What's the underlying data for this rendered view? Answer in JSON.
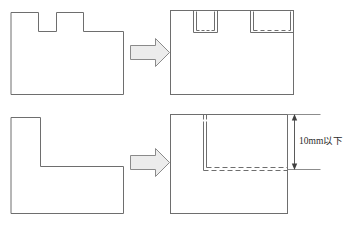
{
  "diagram": {
    "canvas": {
      "width": 343,
      "height": 226
    },
    "stroke_color": "#6e6e6e",
    "arrow_fill_color": "#ececec",
    "arrow_stroke_color": "#8a8a8a",
    "dimension_color": "#404040",
    "background_color": "#ffffff",
    "rows": [
      {
        "id": "row-top",
        "before": {
          "name": "top-left-notched-plate",
          "description": "Rectangular plate with two square notches cut into the top edge",
          "notch_count": 2
        },
        "arrow": {
          "name": "transform-arrow-top",
          "direction": "right",
          "glyph": "➡"
        },
        "after": {
          "name": "top-right-filled-plate",
          "description": "Full rectangular plate with the two former notches shown as inner outlines, bottoms drawn dashed",
          "notch_count": 2,
          "inner_line_styles": [
            "solid-sides",
            "dashed-bottom"
          ]
        }
      },
      {
        "id": "row-bottom",
        "before": {
          "name": "bottom-left-l-shape",
          "description": "L-shaped plate, large notch removed from the upper right"
        },
        "arrow": {
          "name": "transform-arrow-bottom",
          "direction": "right",
          "glyph": "➡"
        },
        "after": {
          "name": "bottom-right-filled-plate",
          "description": "Full rectangular plate with an inner L outline, vertical solid and horizontal dashed, plus a small slit at the top edge"
        },
        "dimension": {
          "name": "height-dimension",
          "label": "10mm以下",
          "value": "10",
          "unit": "mm",
          "qualifier": "以下",
          "orientation": "vertical",
          "has_arrowheads_both_ends": true
        }
      }
    ]
  }
}
